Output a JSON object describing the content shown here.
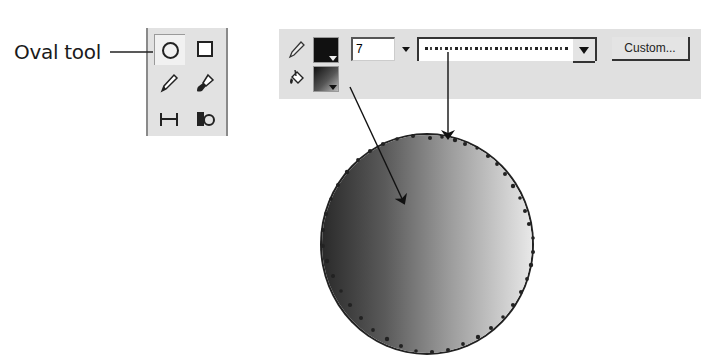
{
  "callout": {
    "label": "Oval tool"
  },
  "toolbox": {
    "tools": [
      {
        "name": "oval-tool",
        "icon": "oval-icon",
        "selected": true
      },
      {
        "name": "rectangle-tool",
        "icon": "rectangle-icon",
        "selected": false
      },
      {
        "name": "pencil-tool",
        "icon": "pencil-icon",
        "selected": false
      },
      {
        "name": "brush-tool",
        "icon": "brush-icon",
        "selected": false
      },
      {
        "name": "free-transform-tool",
        "icon": "transform-icon",
        "selected": false
      },
      {
        "name": "fill-transform-tool",
        "icon": "fill-transform-icon",
        "selected": false
      }
    ]
  },
  "properties": {
    "stroke_icon": "pencil-icon",
    "fill_icon": "paint-bucket-icon",
    "stroke_color": "#111111",
    "fill_gradient": "black-to-white linear gradient",
    "stroke_height": "7",
    "stroke_style": "dotted/stippled",
    "custom_button": "Custom..."
  },
  "illustration": {
    "shape": "circle with linear gradient fill and stippled stroke",
    "gradient_colors": [
      "#2a2a2a",
      "#e8e8e8"
    ]
  }
}
